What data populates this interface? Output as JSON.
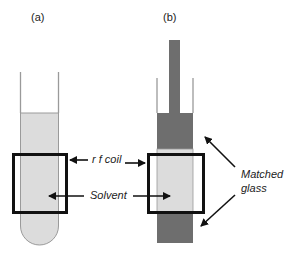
{
  "panels": {
    "a": {
      "label": "(a)"
    },
    "b": {
      "label": "(b)"
    }
  },
  "annotations": {
    "rf_coil": "r f coil",
    "solvent": "Solvent",
    "matched_glass_line1": "Matched",
    "matched_glass_line2": "glass"
  },
  "colors": {
    "solvent": "#dcdcdc",
    "matched_glass": "#6e6e6e",
    "tube_wall": "#9a9a9a",
    "coil": "#111111"
  }
}
